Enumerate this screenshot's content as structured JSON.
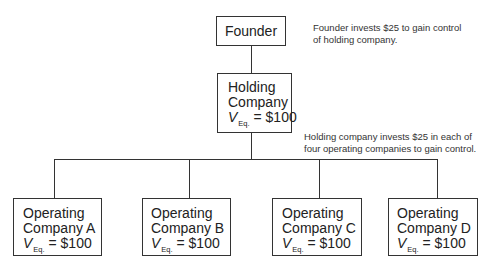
{
  "founder": {
    "label": "Founder"
  },
  "founder_note": {
    "lines": [
      "Founder invests $25 to gain control",
      "of holding company."
    ]
  },
  "holding": {
    "line1": "Holding",
    "line2": "Company",
    "value_var": "V",
    "value_sub": "Eq.",
    "value_text": "= $100"
  },
  "holding_note": {
    "lines": [
      "Holding company invests $25 in each of",
      "four operating companies to gain control."
    ]
  },
  "operating": [
    {
      "line1": "Operating",
      "line2": "Company A",
      "value_var": "V",
      "value_sub": "Eq.",
      "value_text": "= $100"
    },
    {
      "line1": "Operating",
      "line2": "Company B",
      "value_var": "V",
      "value_sub": "Eq.",
      "value_text": "= $100"
    },
    {
      "line1": "Operating",
      "line2": "Company C",
      "value_var": "V",
      "value_sub": "Eq.",
      "value_text": "= $100"
    },
    {
      "line1": "Operating",
      "line2": "Company D",
      "value_var": "V",
      "value_sub": "Eq.",
      "value_text": "= $100"
    }
  ]
}
